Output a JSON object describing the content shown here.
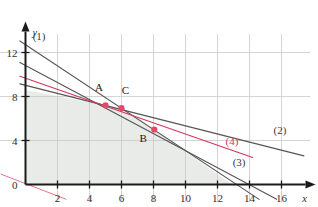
{
  "chart_data": {
    "type": "line",
    "title": "",
    "xlabel": "x",
    "ylabel": "y",
    "xlim": [
      -1.6,
      17.8
    ],
    "ylim": [
      -1.6,
      14.2
    ],
    "grid": true,
    "legend_position": "inline-annotations",
    "x_ticks": [
      2,
      4,
      6,
      8,
      10,
      12,
      14,
      16
    ],
    "x_tick_labels": [
      "2",
      "4",
      "6",
      "8",
      "10",
      "12",
      "14",
      "16"
    ],
    "y_ticks": [
      0,
      4,
      8,
      12
    ],
    "y_tick_labels": [
      "0",
      "4",
      "8",
      "12"
    ],
    "grid_x": [
      2,
      4,
      6,
      8,
      10,
      12,
      14,
      16
    ],
    "grid_y": [
      4,
      8,
      12
    ],
    "series": [
      {
        "name": "(1)",
        "label": "(1)",
        "color": "#555555",
        "label_x": 0.85,
        "label_y": 13.1,
        "p1_x": -0.35,
        "p1_y": 13.05,
        "p2_x": 14.6,
        "p2_y": -1.35
      },
      {
        "name": "(2)",
        "label": "(2)",
        "color": "#555555",
        "label_x": 15.9,
        "label_y": 4.55,
        "p1_x": -0.35,
        "p1_y": 9.15,
        "p2_x": 17.4,
        "p2_y": 2.6
      },
      {
        "name": "(3)",
        "label": "(3)",
        "color": "#555555",
        "label_x": 13.35,
        "label_y": 1.7,
        "p1_x": -0.35,
        "p1_y": 11.1,
        "p2_x": 15.7,
        "p2_y": -1.35
      },
      {
        "name": "(4)",
        "label": "(4)",
        "color": "#d4375c",
        "label_x": 12.9,
        "label_y": 3.6,
        "p1_x": -0.35,
        "p1_y": 9.85,
        "p2_x": 14.2,
        "p2_y": 2.45
      }
    ],
    "objective_line": {
      "name": "objective-direction-line",
      "color": "#e0768f",
      "p1_x": -1.55,
      "p1_y": 0.95,
      "p2_x": 2.55,
      "p2_y": -1.35
    },
    "points": [
      {
        "name": "A",
        "label": "A",
        "x": 5.0,
        "y": 7.2,
        "label_x": 4.6,
        "label_y": 8.5
      },
      {
        "name": "C",
        "label": "C",
        "x": 6.0,
        "y": 6.95,
        "label_x": 6.25,
        "label_y": 8.25
      },
      {
        "name": "B",
        "label": "B",
        "x": 8.05,
        "y": 5.0,
        "label_x": 7.35,
        "label_y": 3.85
      }
    ],
    "point_color": "#e5486b",
    "feasible_region": {
      "name": "feasible-region",
      "fill": "#e8ebe8",
      "vertices": [
        [
          0,
          0
        ],
        [
          0,
          8.6
        ],
        [
          5.0,
          7.2
        ],
        [
          6.0,
          6.95
        ],
        [
          8.05,
          5.0
        ],
        [
          12.9,
          0
        ]
      ]
    },
    "axis_color": "#1a1a1a",
    "grid_color": "#c9c9c9"
  }
}
